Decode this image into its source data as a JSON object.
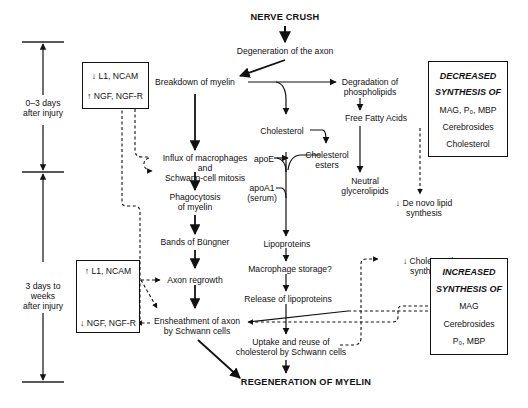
{
  "title": "NERVE CRUSH",
  "outcome": "REGENERATION OF MYELIN",
  "timeline": {
    "phase1": [
      "0–3 days",
      "after injury"
    ],
    "phase2": [
      "3 days to",
      "weeks",
      "after injury"
    ]
  },
  "left_boxes": {
    "early": {
      "line1": "↓ L1, NCAM",
      "line2": "↑ NGF, NGF-R"
    },
    "late": {
      "line1": "↑ L1, NCAM",
      "line2": "↓ NGF, NGF-R"
    }
  },
  "nodes": {
    "degeneration": "Degeneration of the axon",
    "breakdown": "Breakdown of myelin",
    "influx": "Influx of macrophages",
    "and": "and",
    "mitosis": "Schwann-cell mitosis",
    "phago1": "Phagocytosis",
    "phago2": "of myelin",
    "bands": "Bands of Büngner",
    "regrowth": "Axon regrowth",
    "ensheath1": "Ensheathment of axon",
    "ensheath2": "by Schwann cells",
    "degradation1": "Degradation of",
    "degradation2": "phospholipids",
    "ffa": "Free Fatty Acids",
    "cholesterol": "Cholesterol",
    "chol_esters1": "Cholesterol",
    "chol_esters2": "esters",
    "neutral1": "Neutral",
    "neutral2": "glycerolipids",
    "denovo1": "↓ De novo lipid",
    "denovo2": "synthesis",
    "apoe": "apoE",
    "apoa1_1": "apoA1",
    "apoa1_2": "(serum)",
    "lipoproteins": "Lipoproteins",
    "macro_storage": "Macrophage storage?",
    "release": "Release of lipoproteins",
    "uptake1": "Uptake and reuse of",
    "uptake2": "cholesterol by Schwann cells",
    "chol_synth1": "↓ Cholesterol",
    "chol_synth2": "synthesis"
  },
  "decreased_box": {
    "heading1": "DECREASED",
    "heading2": "SYNTHESIS OF",
    "items": [
      "MAG, P₀, MBP",
      "Cerebrosides",
      "Cholesterol"
    ]
  },
  "increased_box": {
    "heading1": "INCREASED",
    "heading2": "SYNTHESIS OF",
    "items": [
      "MAG",
      "Cerebrosides",
      "P₀, MBP"
    ]
  }
}
